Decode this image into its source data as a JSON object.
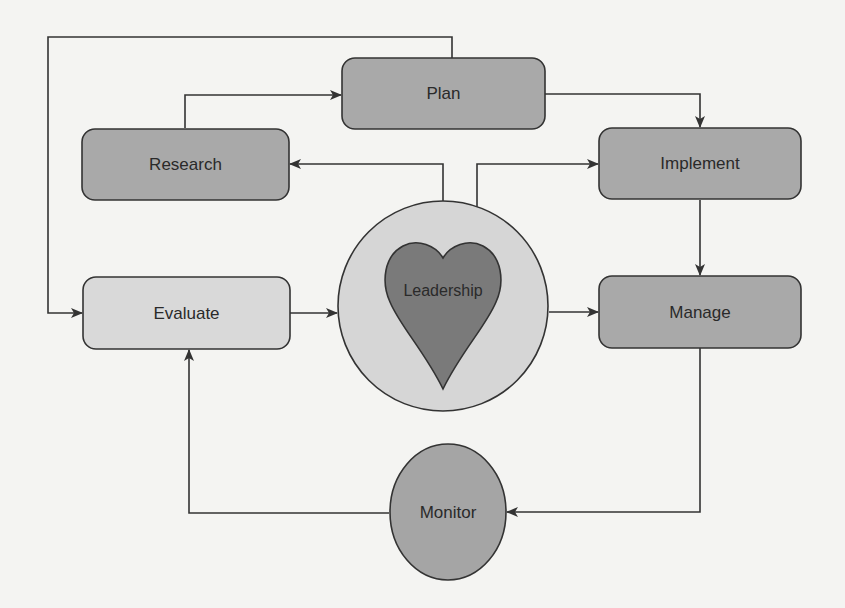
{
  "diagram": {
    "type": "flow-cycle",
    "colors": {
      "background": "#f4f4f2",
      "stroke": "#333333",
      "box_dark": "#a9a9a9",
      "box_light": "#d9d9d9",
      "circle_outer": "#d6d6d6",
      "heart": "#7a7a7a",
      "monitor": "#a5a5a5"
    },
    "nodes": {
      "plan": {
        "label": "Plan",
        "shape": "rounded-rect"
      },
      "research": {
        "label": "Research",
        "shape": "rounded-rect"
      },
      "implement": {
        "label": "Implement",
        "shape": "rounded-rect"
      },
      "evaluate": {
        "label": "Evaluate",
        "shape": "rounded-rect"
      },
      "manage": {
        "label": "Manage",
        "shape": "rounded-rect"
      },
      "leadership": {
        "label": "Leadership",
        "shape": "heart-in-circle"
      },
      "monitor": {
        "label": "Monitor",
        "shape": "ellipse"
      }
    },
    "edges": [
      {
        "from": "research",
        "to": "plan"
      },
      {
        "from": "plan",
        "to": "implement"
      },
      {
        "from": "leadership",
        "to": "research"
      },
      {
        "from": "leadership",
        "to": "implement"
      },
      {
        "from": "implement",
        "to": "manage"
      },
      {
        "from": "leadership",
        "to": "manage"
      },
      {
        "from": "manage",
        "to": "monitor"
      },
      {
        "from": "monitor",
        "to": "evaluate"
      },
      {
        "from": "evaluate",
        "to": "leadership"
      },
      {
        "from": "plan",
        "to": "evaluate"
      }
    ]
  }
}
